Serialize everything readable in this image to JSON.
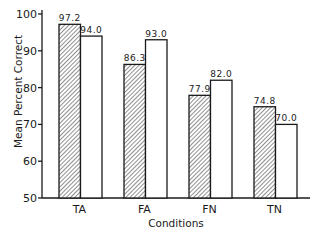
{
  "chart_data": {
    "type": "bar",
    "title": "",
    "xlabel": "Conditions",
    "ylabel": "Mean Percent Correct",
    "ylim": [
      50,
      100
    ],
    "yticks": [
      50,
      60,
      70,
      80,
      90,
      100
    ],
    "categories": [
      "TA",
      "FA",
      "FN",
      "TN"
    ],
    "series": [
      {
        "name": "hatched",
        "pattern": "diagonal-hatch",
        "values": [
          97.2,
          86.3,
          77.9,
          74.8
        ]
      },
      {
        "name": "open",
        "pattern": "none",
        "values": [
          94.0,
          93.0,
          82.0,
          70.0
        ]
      }
    ],
    "value_labels": [
      [
        "97.2",
        "94.0"
      ],
      [
        "86.3",
        "93.0"
      ],
      [
        "77.9",
        "82.0"
      ],
      [
        "74.8",
        "70.0"
      ]
    ],
    "legend": null,
    "grid": false
  },
  "colors": {
    "ink": "#1a1a1a",
    "background": "#ffffff"
  }
}
